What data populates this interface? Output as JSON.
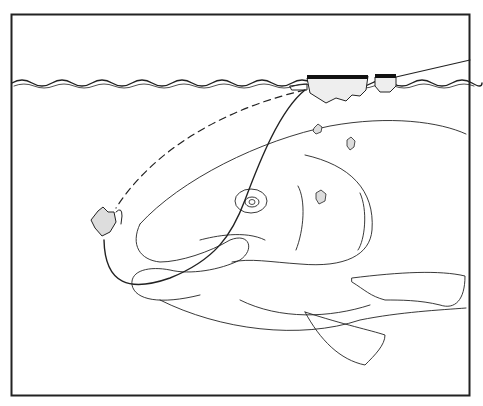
{
  "illustration": {
    "subject": "fish-taking-floating-bait-below-water-surface",
    "colors": {
      "ink": "#222222",
      "background": "#ffffff"
    },
    "elements": [
      "frame",
      "water-surface",
      "floating-bait-clumps",
      "fishing-line",
      "slack-line-dashed",
      "hook-with-bait",
      "fish-head",
      "eye",
      "mouth",
      "pectoral-fin",
      "pelvic-fin",
      "crumbs"
    ]
  }
}
